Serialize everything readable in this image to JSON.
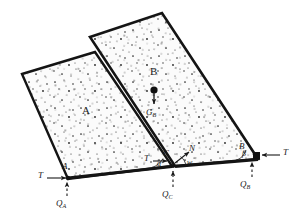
{
  "figure": {
    "type": "engineering-free-body-diagram",
    "colors": {
      "outline": "#141414",
      "fill": "#fbfbfb",
      "stipple": "#2a2a2a",
      "base_line": "#141414",
      "arrow": "#1a1a1a"
    }
  },
  "blocks": [
    {
      "id": "A",
      "label": "A",
      "label_pos": {
        "x": 85,
        "y": 113
      },
      "points": "22,74 95,52 172,166 68,179"
    },
    {
      "id": "B",
      "label": "B",
      "label_pos": {
        "x": 152,
        "y": 75
      },
      "points": "90,37 162,13 258,159 175,166"
    }
  ],
  "labels": [
    {
      "name": "block-a-label",
      "text": "A",
      "x": 84,
      "y": 108,
      "size": "sz11",
      "style": "normal"
    },
    {
      "name": "block-b-label",
      "text": "B",
      "x": 151,
      "y": 70,
      "size": "sz11",
      "style": "normal"
    },
    {
      "name": "gb-label",
      "text": "G",
      "sub": "B",
      "x": 146,
      "y": 113,
      "size": "sz9",
      "style": "italic"
    },
    {
      "name": "vertex-a-label",
      "text": "A",
      "x": 61,
      "y": 166,
      "size": "sz9",
      "style": "italic"
    },
    {
      "name": "vertex-b-label",
      "text": "B",
      "x": 243,
      "y": 146,
      "size": "sz9",
      "style": "italic"
    },
    {
      "name": "vertex-c-label",
      "text": "C",
      "x": 164,
      "y": 153,
      "size": "sz9",
      "style": "italic"
    },
    {
      "name": "normal-force-label",
      "text": "N",
      "x": 190,
      "y": 150,
      "size": "sz9",
      "style": "italic"
    },
    {
      "name": "tension-left-label",
      "text": "T",
      "x": 40,
      "y": 172,
      "size": "sz9",
      "style": "italic"
    },
    {
      "name": "tension-mid-label",
      "text": "T",
      "x": 146,
      "y": 158,
      "size": "sz9",
      "style": "italic"
    },
    {
      "name": "tension-right-label",
      "text": "T",
      "x": 283,
      "y": 151,
      "size": "sz9",
      "style": "italic"
    },
    {
      "name": "reaction-qa-label",
      "text": "Q",
      "sub": "A",
      "x": 56,
      "y": 202,
      "size": "sz9",
      "style": "italic"
    },
    {
      "name": "reaction-qc-label",
      "text": "Q",
      "sub": "C",
      "x": 163,
      "y": 193,
      "size": "sz9",
      "style": "italic"
    },
    {
      "name": "reaction-qb-label",
      "text": "Q",
      "sub": "B",
      "x": 240,
      "y": 182,
      "size": "sz9",
      "style": "italic"
    },
    {
      "name": "angle-alpha-label",
      "text": "α",
      "x": 158,
      "y": 164,
      "size": "sz8",
      "style": "italic"
    },
    {
      "name": "angle-beta-label",
      "text": "β",
      "x": 243,
      "y": 154,
      "size": "sz8",
      "style": "italic"
    },
    {
      "name": "angle-w-label",
      "text": "w",
      "x": 188,
      "y": 163,
      "size": "sz8",
      "style": "italic"
    }
  ],
  "forces": [
    {
      "name": "tension-left-arrow",
      "symbol": "T",
      "direction": "right",
      "at_vertex": "A"
    },
    {
      "name": "tension-mid-arrow",
      "symbol": "T",
      "direction": "right",
      "at_vertex": "C"
    },
    {
      "name": "tension-right-arrow",
      "symbol": "T",
      "direction": "left",
      "at_vertex": "B"
    },
    {
      "name": "reaction-qa-arrow",
      "symbol": "Q_A",
      "direction": "up",
      "style": "dashed",
      "at_vertex": "A"
    },
    {
      "name": "reaction-qc-arrow",
      "symbol": "Q_C",
      "direction": "up",
      "style": "dashed",
      "at_vertex": "C"
    },
    {
      "name": "reaction-qb-arrow",
      "symbol": "Q_B",
      "direction": "up",
      "style": "dashed",
      "at_vertex": "B"
    },
    {
      "name": "weight-gb-arrow",
      "symbol": "G_B",
      "direction": "down",
      "at_point": "center-of-gravity-B"
    },
    {
      "name": "normal-n-arrow",
      "symbol": "N",
      "direction": "up-right",
      "at_vertex": "C"
    }
  ],
  "angles": [
    {
      "name": "alpha",
      "symbol": "α",
      "at_vertex": "C",
      "between": [
        "interface-AB",
        "base"
      ]
    },
    {
      "name": "beta",
      "symbol": "β",
      "at_vertex": "B",
      "between": [
        "right-face-B",
        "base"
      ]
    },
    {
      "name": "w",
      "symbol": "w",
      "at_vertex": "C",
      "between": [
        "base",
        "N-direction"
      ]
    }
  ]
}
